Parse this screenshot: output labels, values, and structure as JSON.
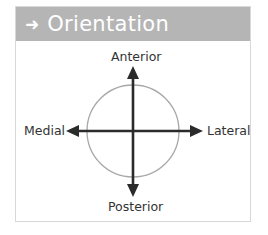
{
  "header": {
    "icon": "arrow-right-icon",
    "arrow_glyph": "➜",
    "title": "Orientation"
  },
  "labels": {
    "top": "Anterior",
    "bottom": "Posterior",
    "left": "Medial",
    "right": "Lateral"
  },
  "colors": {
    "header_bg": "#b5b5b5",
    "arrow": "#2b2b2b",
    "circle": "#a8a8a8",
    "border": "#d8d8d8"
  }
}
